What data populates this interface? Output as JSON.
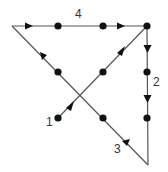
{
  "diagram": {
    "title": "",
    "colors": {
      "line": "#555555",
      "dot": "#111111",
      "arrow": "#111111",
      "label": "#333333",
      "background": "#ffffff"
    },
    "dots": [
      {
        "x": 58,
        "y": 26
      },
      {
        "x": 103,
        "y": 26
      },
      {
        "x": 147,
        "y": 26
      },
      {
        "x": 58,
        "y": 72
      },
      {
        "x": 103,
        "y": 72
      },
      {
        "x": 147,
        "y": 72
      },
      {
        "x": 58,
        "y": 118
      },
      {
        "x": 103,
        "y": 118
      },
      {
        "x": 147,
        "y": 118
      }
    ],
    "segments": [
      {
        "label": "1",
        "from": [
          58,
          118
        ],
        "to": [
          147,
          26
        ],
        "label_pos": [
          50,
          124
        ]
      },
      {
        "label": "2",
        "from": [
          147,
          26
        ],
        "to": [
          148,
          165
        ],
        "label_pos": [
          155,
          86
        ]
      },
      {
        "label": "3",
        "from": [
          148,
          165
        ],
        "to": [
          12,
          26
        ],
        "label_pos": [
          115,
          153
        ]
      },
      {
        "label": "4",
        "from": [
          12,
          26
        ],
        "to": [
          147,
          26
        ],
        "label_pos": [
          76,
          18
        ]
      }
    ],
    "labels": {
      "seg1": "1",
      "seg2": "2",
      "seg3": "3",
      "seg4": "4"
    }
  }
}
